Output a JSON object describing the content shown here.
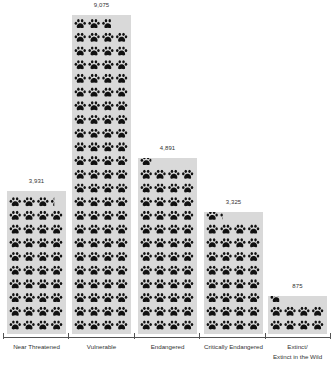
{
  "chart_data": {
    "type": "bar",
    "subtype": "pictograph",
    "title": "",
    "xlabel": "",
    "ylabel": "",
    "unit_note": "each paw icon ≈ 100 species",
    "categories": [
      "Near Threatened",
      "Vulnerable",
      "Endangered",
      "Critically Endangered",
      "Extinct/ Extinct in the Wild"
    ],
    "category_lines": [
      [
        "Near Threatened"
      ],
      [
        "Vulnerable"
      ],
      [
        "Endangered"
      ],
      [
        "Critically Endangered"
      ],
      [
        "Extinct/",
        "Extinct in the Wild"
      ]
    ],
    "values": [
      3931,
      9075,
      4891,
      3325,
      875
    ],
    "value_labels": [
      "3,931",
      "9,075",
      "4,891",
      "3,325",
      "875"
    ],
    "ylim": [
      0,
      9500
    ],
    "grid": false,
    "legend": null,
    "colors": {
      "bar": "#d9d9d9",
      "icon": "#111111",
      "axis": "#555555"
    }
  }
}
